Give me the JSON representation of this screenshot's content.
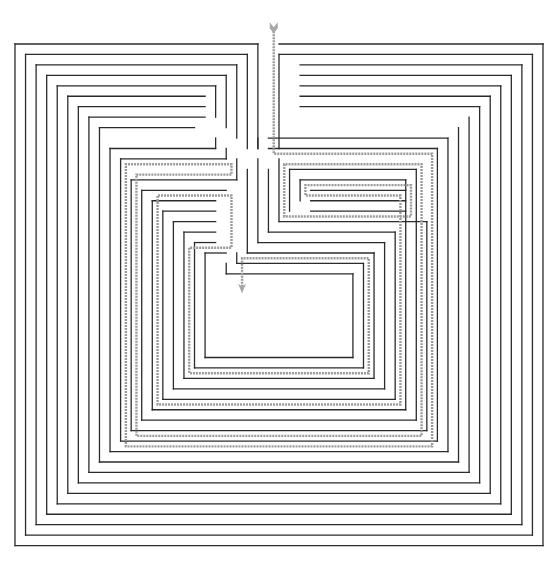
{
  "diagram": {
    "type": "spiral-maze",
    "title_fragment": "",
    "colors": {
      "wall": "#2b2b2b",
      "solution_path": "#9a9a9a",
      "background": "#ffffff"
    },
    "grid": {
      "cols": 51,
      "rows": 49
    },
    "entrance": {
      "col": 24,
      "row": 0,
      "label": "start-arrow"
    },
    "goal": {
      "col": 21,
      "row": 22,
      "label": "end-arrow"
    },
    "walls": [
      [
        0,
        0,
        23,
        0
      ],
      [
        23,
        0,
        23,
        10
      ],
      [
        25,
        0,
        50,
        0
      ],
      [
        50,
        0,
        50,
        48
      ],
      [
        50,
        48,
        0,
        48
      ],
      [
        0,
        48,
        0,
        0
      ],
      [
        1,
        1,
        22,
        1
      ],
      [
        22,
        1,
        22,
        10
      ],
      [
        25,
        1,
        25,
        10
      ],
      [
        25,
        1,
        49,
        1
      ],
      [
        49,
        1,
        49,
        47
      ],
      [
        49,
        47,
        1,
        47
      ],
      [
        1,
        47,
        1,
        1
      ],
      [
        2,
        2,
        21,
        2
      ],
      [
        21,
        2,
        21,
        9
      ],
      [
        27,
        2,
        48,
        2
      ],
      [
        48,
        2,
        48,
        46
      ],
      [
        48,
        46,
        2,
        46
      ],
      [
        2,
        46,
        2,
        2
      ],
      [
        3,
        3,
        20,
        3
      ],
      [
        20,
        3,
        20,
        8
      ],
      [
        27,
        3,
        47,
        3
      ],
      [
        47,
        3,
        47,
        45
      ],
      [
        47,
        45,
        3,
        45
      ],
      [
        3,
        45,
        3,
        3
      ],
      [
        4,
        4,
        19,
        4
      ],
      [
        19,
        4,
        19,
        7
      ],
      [
        27,
        4,
        46,
        4
      ],
      [
        46,
        4,
        46,
        44
      ],
      [
        46,
        44,
        4,
        44
      ],
      [
        4,
        44,
        4,
        4
      ],
      [
        5,
        5,
        18,
        5
      ],
      [
        27,
        5,
        45,
        5
      ],
      [
        45,
        5,
        45,
        43
      ],
      [
        45,
        43,
        5,
        43
      ],
      [
        5,
        43,
        5,
        5
      ],
      [
        6,
        6,
        18,
        6
      ],
      [
        27,
        6,
        44,
        6
      ],
      [
        44,
        6,
        44,
        42
      ],
      [
        44,
        42,
        6,
        42
      ],
      [
        6,
        42,
        6,
        6
      ],
      [
        7,
        7,
        18,
        7
      ],
      [
        43,
        7,
        43,
        41
      ],
      [
        43,
        41,
        7,
        41
      ],
      [
        7,
        41,
        7,
        7
      ],
      [
        8,
        8,
        17,
        8
      ],
      [
        42,
        8,
        42,
        40
      ],
      [
        42,
        40,
        8,
        40
      ],
      [
        8,
        40,
        8,
        8
      ],
      [
        9,
        10,
        19,
        10
      ],
      [
        19,
        10,
        19,
        9
      ],
      [
        23,
        10,
        23,
        9
      ],
      [
        24,
        9,
        41,
        9
      ],
      [
        41,
        9,
        41,
        39
      ],
      [
        41,
        39,
        9,
        39
      ],
      [
        9,
        39,
        9,
        10
      ],
      [
        10,
        11,
        20,
        11
      ],
      [
        20,
        11,
        20,
        10
      ],
      [
        24,
        10,
        40,
        10
      ],
      [
        40,
        10,
        40,
        38
      ],
      [
        40,
        38,
        10,
        38
      ],
      [
        10,
        38,
        10,
        11
      ],
      [
        11,
        13,
        21,
        13
      ],
      [
        21,
        13,
        21,
        11
      ],
      [
        25,
        11,
        25,
        17
      ],
      [
        25,
        17,
        39,
        17
      ],
      [
        39,
        17,
        39,
        37
      ],
      [
        39,
        37,
        11,
        37
      ],
      [
        11,
        37,
        11,
        13
      ],
      [
        12,
        14,
        20,
        14
      ],
      [
        26,
        12,
        26,
        16
      ],
      [
        26,
        12,
        38,
        12
      ],
      [
        38,
        12,
        38,
        36
      ],
      [
        38,
        36,
        12,
        36
      ],
      [
        12,
        36,
        12,
        14
      ],
      [
        13,
        15,
        19,
        15
      ],
      [
        27,
        13,
        27,
        15
      ],
      [
        28,
        14,
        37,
        14
      ],
      [
        28,
        15,
        37,
        15
      ],
      [
        28,
        16,
        37,
        16
      ],
      [
        27,
        13,
        37,
        13
      ],
      [
        37,
        13,
        37,
        35
      ],
      [
        37,
        35,
        13,
        35
      ],
      [
        13,
        35,
        13,
        15
      ],
      [
        14,
        16,
        19,
        16
      ],
      [
        14,
        16,
        14,
        34
      ],
      [
        14,
        34,
        36,
        34
      ],
      [
        36,
        34,
        36,
        18
      ],
      [
        36,
        18,
        24,
        18
      ],
      [
        24,
        18,
        24,
        12
      ],
      [
        15,
        17,
        19,
        17
      ],
      [
        15,
        17,
        15,
        33
      ],
      [
        15,
        33,
        35,
        33
      ],
      [
        35,
        33,
        35,
        19
      ],
      [
        35,
        19,
        23,
        19
      ],
      [
        23,
        19,
        23,
        11
      ],
      [
        16,
        18,
        19,
        18
      ],
      [
        16,
        18,
        16,
        32
      ],
      [
        16,
        32,
        34,
        32
      ],
      [
        34,
        32,
        34,
        20
      ],
      [
        34,
        20,
        22,
        20
      ],
      [
        22,
        20,
        22,
        12
      ],
      [
        17,
        19,
        19,
        19
      ],
      [
        17,
        19,
        17,
        31
      ],
      [
        17,
        31,
        33,
        31
      ],
      [
        33,
        31,
        33,
        21
      ],
      [
        33,
        21,
        21,
        21
      ],
      [
        21,
        21,
        21,
        20
      ],
      [
        18,
        20,
        20,
        20
      ],
      [
        18,
        20,
        18,
        30
      ],
      [
        18,
        30,
        32,
        30
      ],
      [
        32,
        30,
        32,
        22
      ],
      [
        32,
        22,
        20,
        22
      ],
      [
        20,
        22,
        20,
        21
      ]
    ],
    "solution": [
      [
        24.5,
        -1.5
      ],
      [
        24.5,
        10.5
      ],
      [
        39.5,
        10.5
      ],
      [
        39.5,
        38.5
      ],
      [
        10.5,
        38.5
      ],
      [
        10.5,
        11.5
      ],
      [
        20.5,
        11.5
      ],
      [
        20.5,
        12.5
      ],
      [
        11.5,
        12.5
      ],
      [
        11.5,
        37.5
      ],
      [
        38.5,
        37.5
      ],
      [
        38.5,
        11.5
      ],
      [
        25.5,
        11.5
      ],
      [
        25.5,
        16.5
      ],
      [
        37.5,
        16.5
      ],
      [
        37.5,
        13.5
      ],
      [
        27.5,
        13.5
      ],
      [
        27.5,
        14.5
      ],
      [
        36.5,
        14.5
      ],
      [
        36.5,
        34.5
      ],
      [
        13.5,
        34.5
      ],
      [
        13.5,
        14.5
      ],
      [
        20.5,
        14.5
      ],
      [
        20.5,
        19.5
      ],
      [
        16.5,
        19.5
      ],
      [
        16.5,
        31.5
      ],
      [
        33.5,
        31.5
      ],
      [
        33.5,
        20.5
      ],
      [
        21.5,
        20.5
      ],
      [
        21.5,
        23.5
      ]
    ]
  }
}
